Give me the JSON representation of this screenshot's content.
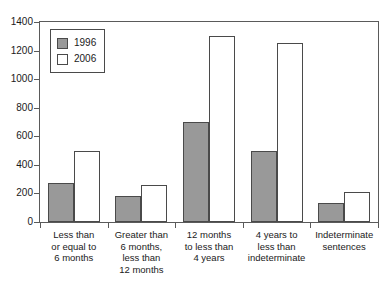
{
  "chart_data": {
    "type": "bar",
    "title": "",
    "xlabel": "",
    "ylabel": "",
    "ylim": [
      0,
      1400
    ],
    "ytick_step": 200,
    "yticks": [
      1400,
      1200,
      1000,
      800,
      600,
      400,
      200,
      0
    ],
    "grid": false,
    "legend_position": "top-left",
    "categories": [
      "Less than or equal to 6 months",
      "Greater than 6 months, less than 12 months",
      "12 months to less than 4 years",
      "4 years to less than indeterminate",
      "Indeterminate sentences"
    ],
    "category_lines": [
      [
        "Less than",
        "or equal to",
        "6 months"
      ],
      [
        "Greater than",
        "6 months,",
        "less than",
        "12 months"
      ],
      [
        "12 months",
        "to less than",
        "4 years"
      ],
      [
        "4 years to",
        "less than",
        "indeterminate"
      ],
      [
        "Indeterminate",
        "sentences"
      ]
    ],
    "series": [
      {
        "name": "1996",
        "color": "#999999",
        "values": [
          270,
          180,
          700,
          500,
          130
        ]
      },
      {
        "name": "2006",
        "color": "#ffffff",
        "values": [
          500,
          260,
          1300,
          1250,
          210
        ]
      }
    ]
  }
}
